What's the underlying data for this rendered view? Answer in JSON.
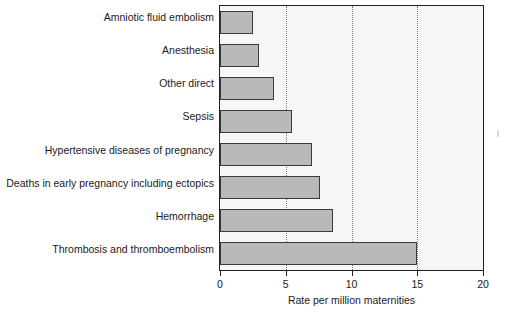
{
  "chart_data": {
    "type": "bar",
    "orientation": "horizontal",
    "title": "",
    "xlabel": "Rate per million maternities",
    "ylabel": "",
    "xlim": [
      0,
      20
    ],
    "xticks": [
      0,
      5,
      10,
      15,
      20
    ],
    "xtick_labels": [
      "0",
      "5",
      "10",
      "15",
      "20"
    ],
    "grid": "vertical dotted gridlines at 5, 10, 15",
    "legend": "none",
    "bar_color": "#b9b9b9",
    "bar_edge_color": "#3a3a3a",
    "plot_background": "#f6f6f6",
    "frame_color": "#231f20",
    "categories": [
      "Amniotic fluid embolism",
      "Anesthesia",
      "Other direct",
      "Sepsis",
      "Hypertensive diseases of pregnancy",
      "Deaths in early pregnancy including ectopics",
      "Hemorrhage",
      "Thrombosis and thromboembolism"
    ],
    "values": [
      2.5,
      3.0,
      4.1,
      5.5,
      7.0,
      7.6,
      8.6,
      15.0
    ]
  }
}
